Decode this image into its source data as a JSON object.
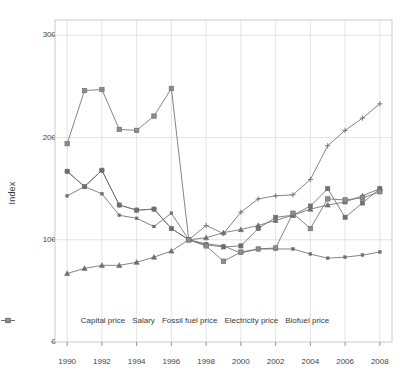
{
  "chart_data": {
    "type": "line",
    "title": "",
    "subtitle": "",
    "xlabel": "",
    "ylabel": "Index",
    "x": [
      1990,
      1991,
      1992,
      1993,
      1994,
      1995,
      1996,
      1997,
      1998,
      1999,
      2000,
      2001,
      2002,
      2003,
      2004,
      2005,
      2006,
      2007,
      2008
    ],
    "xlim": [
      1989.3,
      2008.7
    ],
    "ylim": [
      0,
      315
    ],
    "xticks": [
      1990,
      1992,
      1994,
      1996,
      1998,
      2000,
      2002,
      2004,
      2006,
      2008
    ],
    "xtick_labels": [
      "1990",
      "1992",
      "1994",
      "1996",
      "1998",
      "2000",
      "2002",
      "2004",
      "2006",
      "2008"
    ],
    "yticks": [
      0,
      100,
      200,
      300
    ],
    "ytick_labels": [
      "0",
      "100",
      "200",
      "300"
    ],
    "grid": true,
    "grid_color": "#d9d9d9",
    "legend_position": "bottom-inside",
    "line_color": "#6f6f6f",
    "marker_color": "#6f6f6f",
    "series": [
      {
        "name": "Capital price",
        "marker": "dot-dash",
        "values": [
          143,
          152,
          145,
          124,
          121,
          113,
          126,
          100,
          96,
          94,
          87,
          91,
          91,
          91,
          86,
          82,
          83,
          85,
          88
        ]
      },
      {
        "name": "Salary",
        "marker": "triangle",
        "values": [
          67,
          72,
          75,
          75,
          78,
          83,
          89,
          100,
          102,
          107,
          110,
          114,
          119,
          124,
          130,
          134,
          137,
          143,
          150
        ]
      },
      {
        "name": "Fossil fuel price",
        "marker": "square",
        "values": [
          167,
          152,
          168,
          134,
          129,
          130,
          111,
          100,
          95,
          93,
          94,
          111,
          122,
          124,
          133,
          150,
          122,
          136,
          150
        ]
      },
      {
        "name": "Electricity price",
        "marker": "plus",
        "values": [
          167,
          152,
          168,
          134,
          129,
          130,
          111,
          100,
          114,
          106,
          127,
          140,
          143,
          144,
          159,
          192,
          207,
          219,
          233
        ]
      },
      {
        "name": "Biofuel price",
        "marker": "filled-square",
        "values": [
          194,
          246,
          247,
          208,
          207,
          221,
          248,
          100,
          94,
          79,
          88,
          91,
          92,
          126,
          111,
          140,
          139,
          141,
          147
        ]
      }
    ]
  },
  "axis": {
    "y_title": "Index"
  },
  "legend": [
    {
      "label": "Capital price",
      "marker": "dot-dash-marker"
    },
    {
      "label": "Salary",
      "marker": "triangle-marker"
    },
    {
      "label": "Fossil fuel price",
      "marker": "square-marker"
    },
    {
      "label": "Electricity price",
      "marker": "plus-marker"
    },
    {
      "label": "Biofuel price",
      "marker": "filled-square-marker"
    }
  ]
}
